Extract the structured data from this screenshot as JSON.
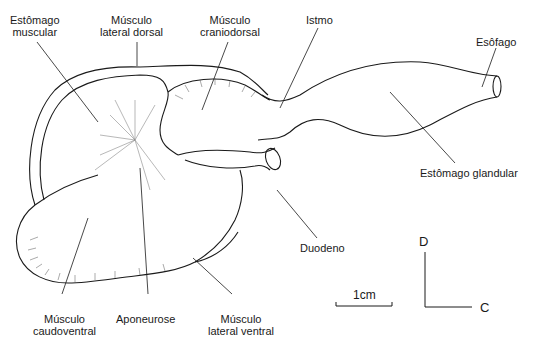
{
  "diagram": {
    "labels": {
      "estomago_muscular": [
        "Estômago",
        "muscular"
      ],
      "musculo_lateral_dorsal": [
        "Músculo",
        "lateral dorsal"
      ],
      "musculo_craniodorsal": [
        "Músculo",
        "craniodorsal"
      ],
      "istmo": "Istmo",
      "esofago": "Esôfago",
      "estomago_glandular": "Estômago glandular",
      "duodeno": "Duodeno",
      "musculo_caudoventral": [
        "Músculo",
        "caudoventral"
      ],
      "aponeurose": "Aponeurose",
      "musculo_lateral_ventral": [
        "Músculo",
        "lateral ventral"
      ]
    },
    "scale_bar": {
      "label": "1cm"
    },
    "orientation": {
      "vertical": "D",
      "horizontal": "C"
    },
    "colors": {
      "ink": "#1a1a1a",
      "background": "#ffffff",
      "hatch": "#555555"
    }
  }
}
